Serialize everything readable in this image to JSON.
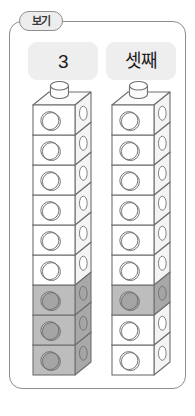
{
  "frame": {
    "tab_label": "보기",
    "border_color": "#8d8d8d",
    "tab_fill": "#ededed"
  },
  "labels": [
    {
      "id": "cardinal",
      "text": "3",
      "box_color": "#eeeeee"
    },
    {
      "id": "ordinal",
      "text": "셋째",
      "box_color": "#eeeeee"
    }
  ],
  "colors": {
    "cube_white_front": "#ffffff",
    "cube_white_side": "#f4f4f4",
    "cube_white_top": "#fbfbfb",
    "cube_gray_front": "#bdbdbd",
    "cube_gray_side": "#a8a8a8",
    "cube_gray_top": "#cfcfcf",
    "circle_gray_fill": "#a5a5a5",
    "outline": "#6f6f6f",
    "background": "#ffffff"
  },
  "towers": [
    {
      "id": "tower-cardinal",
      "caption_ref": "3",
      "cube_count": 9,
      "shaded_count": 3,
      "shaded_positions_from_bottom": [
        1,
        2,
        3
      ],
      "cubes_from_top": [
        "white",
        "white",
        "white",
        "white",
        "white",
        "white",
        "gray",
        "gray",
        "gray"
      ]
    },
    {
      "id": "tower-ordinal",
      "caption_ref": "셋째",
      "cube_count": 9,
      "shaded_count": 1,
      "shaded_positions_from_bottom": [
        3
      ],
      "cubes_from_top": [
        "white",
        "white",
        "white",
        "white",
        "white",
        "white",
        "gray",
        "white",
        "white"
      ]
    }
  ],
  "geometry": {
    "cube_face_width": 42,
    "cube_face_height": 30,
    "depth_x": 16,
    "depth_y": 13,
    "tower_left_x": 33,
    "tower_right_x": 112,
    "tower_top_y": 105,
    "knob_width": 18,
    "knob_height": 17
  }
}
